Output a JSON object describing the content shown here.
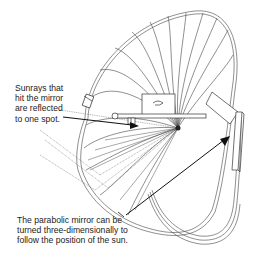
{
  "diagram": {
    "annotations": [
      {
        "id": "sunrays",
        "text": "Sunrays that\nhit the mirror\nare reflected\nto one spot."
      },
      {
        "id": "mirror",
        "text": "The parabolic mirror can be\nturned three-dimensionally to\nfollow the position of the sun."
      }
    ],
    "colors": {
      "line": "#333333",
      "background": "#ffffff",
      "text": "#222222"
    }
  }
}
